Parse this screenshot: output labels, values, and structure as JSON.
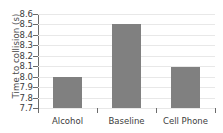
{
  "chart_data": {
    "type": "bar",
    "title": "",
    "xlabel": "",
    "ylabel": "Time to collision (s)",
    "categories": [
      "Alcohol",
      "Baseline",
      "Cell Phone"
    ],
    "values": [
      8.0,
      8.5,
      8.09
    ],
    "ylim": [
      7.7,
      8.6
    ],
    "yticks": [
      "7.7",
      "7.8",
      "7.9",
      "8.0",
      "8.1",
      "8.2",
      "8.3",
      "8.4",
      "8.5",
      "8.6"
    ],
    "grid": true,
    "legend": "none",
    "bar_color": "#808080",
    "gridline_color": "#e8e8e8",
    "axis_color": "#6b6b6b",
    "text_color": "#3c3c3c",
    "background_color": "#ffffff"
  }
}
